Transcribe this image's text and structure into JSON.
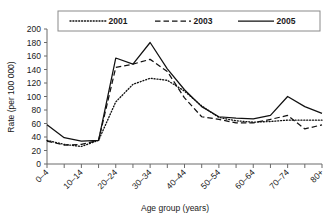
{
  "chart_data": {
    "type": "line",
    "title": "",
    "xlabel": "Age group (years)",
    "ylabel": "Rate (per 100 000)",
    "ylim": [
      0,
      200
    ],
    "yticks": [
      0,
      20,
      40,
      60,
      80,
      100,
      120,
      140,
      160,
      180,
      200
    ],
    "grid": false,
    "legend_position": "top-center",
    "categories": [
      "0–4",
      "5–9",
      "10–14",
      "15–19",
      "20–24",
      "25–29",
      "30–34",
      "35–39",
      "40–44",
      "45–49",
      "50–54",
      "55–59",
      "60–64",
      "65–69",
      "70–74",
      "75–79",
      "80+"
    ],
    "tick_labels_shown": [
      "0–4",
      "",
      "10–14",
      "",
      "20–24",
      "",
      "30–34",
      "",
      "40–44",
      "",
      "50–54",
      "",
      "60–64",
      "",
      "70–74",
      "",
      "80+"
    ],
    "series": [
      {
        "name": "2001",
        "style": "dotted",
        "values": [
          35,
          29,
          26,
          35,
          92,
          118,
          127,
          124,
          108,
          86,
          69,
          64,
          62,
          63,
          65,
          65,
          65
        ]
      },
      {
        "name": "2003",
        "style": "dashed",
        "values": [
          34,
          28,
          29,
          35,
          143,
          148,
          155,
          137,
          98,
          70,
          66,
          61,
          61,
          66,
          72,
          52,
          58
        ]
      },
      {
        "name": "2005",
        "style": "solid",
        "values": [
          58,
          39,
          34,
          35,
          157,
          148,
          180,
          141,
          110,
          85,
          70,
          68,
          67,
          72,
          100,
          85,
          75
        ]
      }
    ]
  },
  "legend": {
    "items": [
      {
        "label": "2001",
        "style": "dotted"
      },
      {
        "label": "2003",
        "style": "dashed"
      },
      {
        "label": "2005",
        "style": "solid"
      }
    ]
  }
}
